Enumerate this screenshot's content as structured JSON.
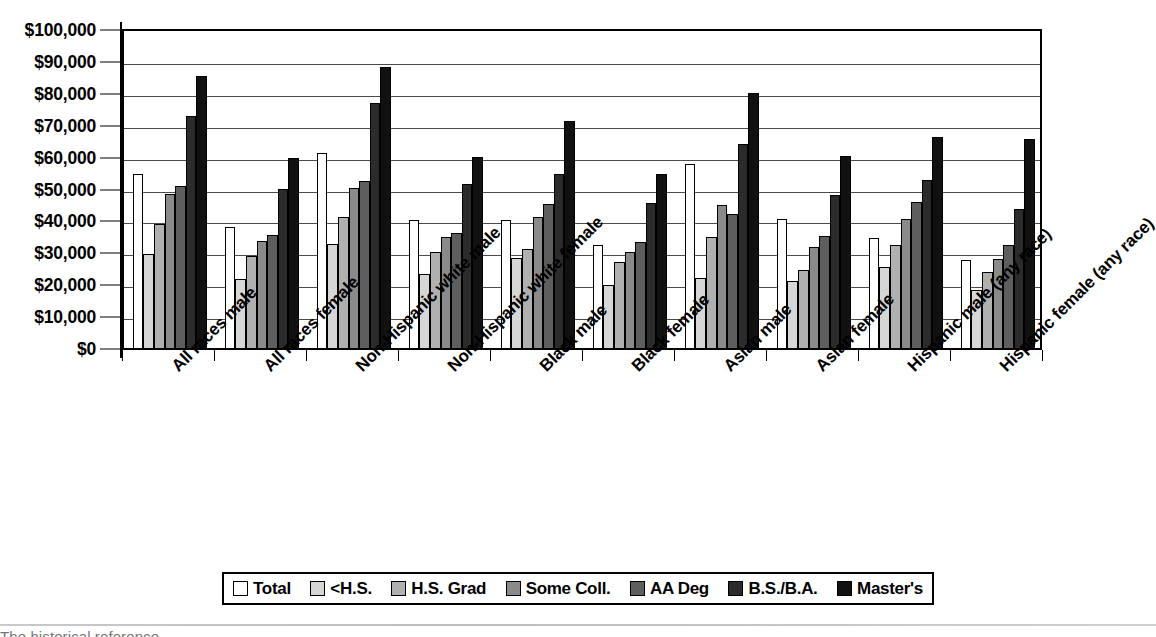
{
  "chart_data": {
    "type": "bar",
    "title": "",
    "xlabel": "",
    "ylabel": "",
    "ylim": [
      0,
      100000
    ],
    "ytick_step": 10000,
    "grid": true,
    "legend_position": "bottom",
    "ytick_labels": [
      "$100,000",
      "$90,000",
      "$80,000",
      "$70,000",
      "$60,000",
      "$50,000",
      "$40,000",
      "$30,000",
      "$20,000",
      "$10,000",
      "$0"
    ],
    "categories": [
      "All races male",
      "All races female",
      "Non-Hispanic white male",
      "Non-Hispanic white female",
      "Black male",
      "Black female",
      "Asian male",
      "Asian female",
      "Hispanic male (any race)",
      "Hispanic female (any race)"
    ],
    "series": [
      {
        "name": "Total",
        "color": "#ffffff",
        "values": [
          54500,
          38000,
          61000,
          40000,
          40000,
          32300,
          57800,
          40500,
          34500,
          27500
        ]
      },
      {
        "name": "<H.S.",
        "color": "#d6d6d6",
        "values": [
          29400,
          21700,
          32600,
          23300,
          28300,
          19600,
          22100,
          21000,
          25300,
          18300
        ]
      },
      {
        "name": "H.S. Grad",
        "color": "#b0b0b0",
        "values": [
          38800,
          28800,
          41000,
          30000,
          30900,
          26900,
          34700,
          24500,
          32300,
          23900
        ]
      },
      {
        "name": "Some Coll.",
        "color": "#8a8a8a",
        "values": [
          48200,
          33600,
          50300,
          34800,
          41000,
          30200,
          44900,
          31800,
          40300,
          27900
        ]
      },
      {
        "name": "AA Deg",
        "color": "#5e5e5e",
        "values": [
          50900,
          35500,
          52300,
          36000,
          45200,
          33100,
          42000,
          35200,
          45700,
          32200
        ]
      },
      {
        "name": "B.S./B.A.",
        "color": "#2b2b2b",
        "values": [
          72800,
          49700,
          76800,
          51300,
          54700,
          45400,
          64000,
          48000,
          52700,
          43500
        ]
      },
      {
        "name": "Master's",
        "color": "#111111",
        "values": [
          85200,
          59700,
          88200,
          59800,
          71100,
          54600,
          79800,
          60300,
          66200,
          65400
        ]
      }
    ]
  },
  "legend": {
    "items": [
      {
        "label": "Total"
      },
      {
        "label": "<H.S."
      },
      {
        "label": "H.S. Grad"
      },
      {
        "label": "Some Coll."
      },
      {
        "label": "AA Deg"
      },
      {
        "label": "B.S./B.A."
      },
      {
        "label": "Master's"
      }
    ]
  },
  "caption": {
    "text": "The historical reference"
  }
}
